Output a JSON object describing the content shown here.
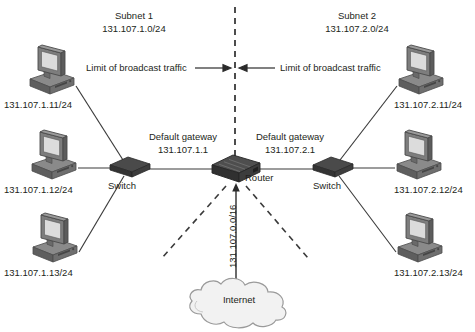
{
  "diagram": {
    "background": "#ffffff",
    "text_color": "#231f20",
    "subnets": [
      {
        "name": "Subnet 1",
        "cidr": "131.107.1.0/24"
      },
      {
        "name": "Subnet 2",
        "cidr": "131.107.2.0/24"
      }
    ],
    "broadcast_limits": [
      {
        "label": "Limit of broadcast traffic",
        "side": "left",
        "arrow": "right-arrow-icon"
      },
      {
        "label": "Limit of broadcast traffic",
        "side": "right",
        "arrow": "left-arrow-icon"
      }
    ],
    "gateways": [
      {
        "title": "Default gateway",
        "address": "131.107.1.1"
      },
      {
        "title": "Default gateway",
        "address": "131.107.2.1"
      }
    ],
    "devices": {
      "switch_left": {
        "label": "Switch",
        "icon": "switch-icon"
      },
      "switch_right": {
        "label": "Switch",
        "icon": "switch-icon"
      },
      "router": {
        "label": "Router",
        "icon": "router-icon"
      },
      "cloud": {
        "label": "Internet",
        "icon": "cloud-icon"
      }
    },
    "supernet": "131.107.0.0/16",
    "hosts_left": [
      {
        "address": "131.107.1.11/24",
        "icon": "computer-icon"
      },
      {
        "address": "131.107.1.12/24",
        "icon": "computer-icon"
      },
      {
        "address": "131.107.1.13/24",
        "icon": "computer-icon"
      }
    ],
    "hosts_right": [
      {
        "address": "131.107.2.11/24",
        "icon": "computer-icon"
      },
      {
        "address": "131.107.2.12/24",
        "icon": "computer-icon"
      },
      {
        "address": "131.107.2.13/24",
        "icon": "computer-icon"
      }
    ]
  }
}
